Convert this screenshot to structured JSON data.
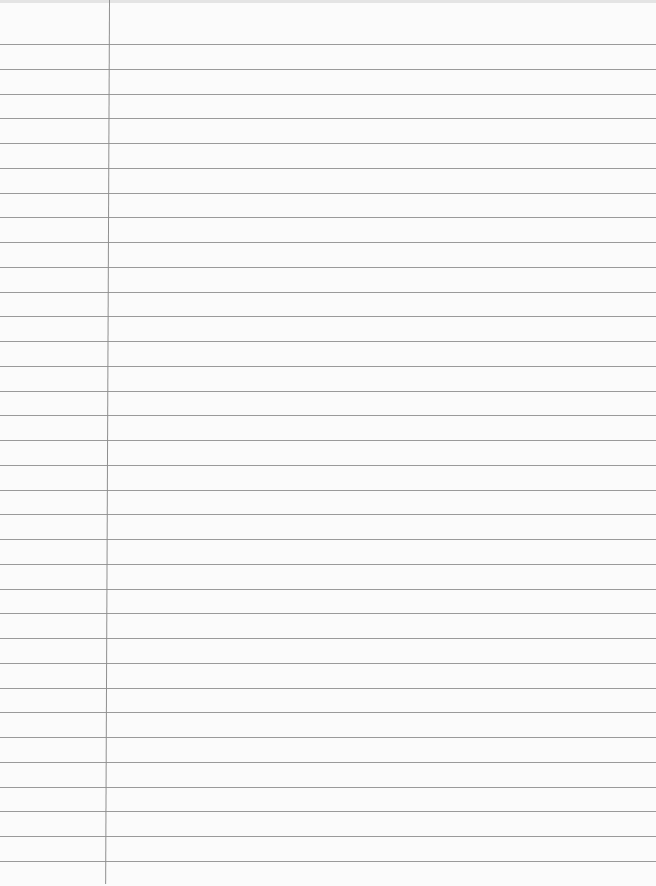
{
  "page": {
    "type": "lined-paper",
    "line_count": 34,
    "text_content": "",
    "colors": {
      "paper": "#fbfbfb",
      "rule": "#9a9a9a",
      "margin": "#8f8f8f"
    }
  }
}
